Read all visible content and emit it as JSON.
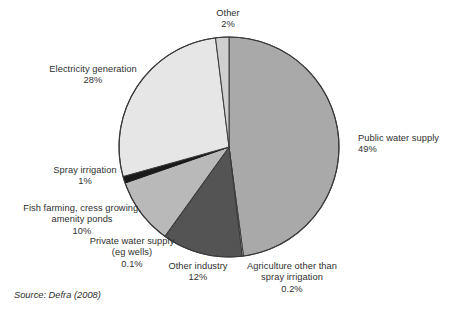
{
  "figure": {
    "source_note": "Source: Defra (2008)"
  },
  "chart_data": {
    "type": "pie",
    "title": "",
    "subtitle": "",
    "xlabel": "",
    "ylabel": "",
    "legend_position": "none (direct labels around slices)",
    "grid": false,
    "units": "percent",
    "total": 100,
    "start_angle_deg": 0,
    "direction": "clockwise",
    "categories": [
      "Public water supply",
      "Agriculture other than spray irrigation",
      "Other industry",
      "Private water supply (eg wells)",
      "Fish farming, cress growing, amenity ponds",
      "Spray irrigation",
      "Electricity generation",
      "Other"
    ],
    "values": [
      49,
      0.2,
      12,
      0.1,
      10,
      1,
      28,
      2
    ],
    "value_labels": [
      "49%",
      "0.2%",
      "12%",
      "0.1%",
      "10%",
      "1%",
      "28%",
      "2%"
    ],
    "colors": [
      "#a9a9a9",
      "#f2f2f2",
      "#545454",
      "#f2f2f2",
      "#b9b9b9",
      "#1a1a1a",
      "#e6e6e6",
      "#cfcfcf"
    ],
    "slices": [
      {
        "name": "public-water-supply",
        "label_lines": [
          "Public water supply",
          "49%"
        ],
        "value": 49,
        "value_label": "49%",
        "color": "#a9a9a9"
      },
      {
        "name": "agriculture-other-than-spray-irrigation",
        "label_lines": [
          "Agriculture other than",
          "spray irrigation",
          "0.2%"
        ],
        "value": 0.2,
        "value_label": "0.2%",
        "color": "#f2f2f2"
      },
      {
        "name": "other-industry",
        "label_lines": [
          "Other industry",
          "12%"
        ],
        "value": 12,
        "value_label": "12%",
        "color": "#545454"
      },
      {
        "name": "private-water-supply",
        "label_lines": [
          "Private water supply",
          "(eg wells)",
          "0.1%"
        ],
        "value": 0.1,
        "value_label": "0.1%",
        "color": "#f2f2f2"
      },
      {
        "name": "fish-farming-cress-growing-amenity-ponds",
        "label_lines": [
          "Fish farming, cress growing,",
          "amenity ponds",
          "10%"
        ],
        "value": 10,
        "value_label": "10%",
        "color": "#b9b9b9"
      },
      {
        "name": "spray-irrigation",
        "label_lines": [
          "Spray irrigation",
          "1%"
        ],
        "value": 1,
        "value_label": "1%",
        "color": "#1a1a1a"
      },
      {
        "name": "electricity-generation",
        "label_lines": [
          "Electricity generation",
          "28%"
        ],
        "value": 28,
        "value_label": "28%",
        "color": "#e6e6e6"
      },
      {
        "name": "other",
        "label_lines": [
          "Other",
          "2%"
        ],
        "value": 2,
        "value_label": "2%",
        "color": "#cfcfcf"
      }
    ]
  },
  "labels": {
    "other": {
      "line1": "Other",
      "line2": "2%"
    },
    "electricity": {
      "line1": "Electricity generation",
      "line2": "28%"
    },
    "public": {
      "line1": "Public water supply",
      "line2": "49%"
    },
    "spray": {
      "line1": "Spray irrigation",
      "line2": "1%"
    },
    "fish": {
      "line1": "Fish farming, cress growing,",
      "line2": "amenity ponds",
      "line3": "10%"
    },
    "private": {
      "line1": "Private water supply",
      "line2": "(eg wells)",
      "line3": "0.1%"
    },
    "other_industry": {
      "line1": "Other industry",
      "line2": "12%"
    },
    "agriculture": {
      "line1": "Agriculture other than",
      "line2": "spray irrigation",
      "line3": "0.2%"
    }
  }
}
